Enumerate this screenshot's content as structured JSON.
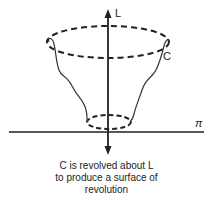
{
  "labels": {
    "axis": "L",
    "curve": "C",
    "plane": "π"
  },
  "caption": {
    "line1": "C is revolved about L",
    "line2": "to produce a surface of",
    "line3": "revolution"
  }
}
